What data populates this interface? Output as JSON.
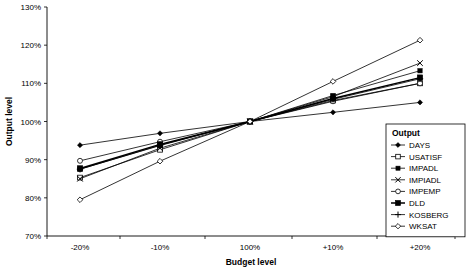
{
  "chart_data": {
    "type": "line",
    "title": "",
    "xlabel": "Budget level",
    "ylabel": "Output level",
    "categories": [
      "-20%",
      "-10%",
      "100%",
      "+10%",
      "+20%"
    ],
    "ytick_labels": [
      "70%",
      "80%",
      "90%",
      "100%",
      "110%",
      "120%",
      "130%"
    ],
    "ytick_values": [
      70,
      80,
      90,
      100,
      110,
      120,
      130
    ],
    "ylim": [
      70,
      130
    ],
    "grid": false,
    "legend_position": "right-inside",
    "legend_title": "Output",
    "series": [
      {
        "name": "DAYS",
        "marker": "filled-diamond",
        "values": [
          93.8,
          96.9,
          100,
          102.4,
          105.0
        ]
      },
      {
        "name": "USATISF",
        "marker": "open-square",
        "values": [
          85.3,
          92.6,
          100,
          105.5,
          110.0
        ]
      },
      {
        "name": "IMPADL",
        "marker": "filled-square",
        "values": [
          87.5,
          93.7,
          100,
          106.8,
          113.3
        ]
      },
      {
        "name": "IMPIADL",
        "marker": "cross-x",
        "values": [
          85.0,
          93.0,
          100,
          106.5,
          115.3
        ]
      },
      {
        "name": "IMPEMP",
        "marker": "open-circle",
        "values": [
          89.7,
          94.7,
          100,
          105.3,
          110.0
        ]
      },
      {
        "name": "DLD",
        "marker": "filled-square-bold",
        "values": [
          87.7,
          94.0,
          100,
          106.0,
          111.5
        ]
      },
      {
        "name": "KOSBERG",
        "marker": "plus",
        "values": [
          87.5,
          93.8,
          100,
          105.8,
          111.2
        ]
      },
      {
        "name": "WKSAT",
        "marker": "open-diamond",
        "values": [
          79.5,
          89.6,
          100,
          110.5,
          121.3
        ]
      }
    ]
  },
  "legend": {
    "title": "Output",
    "items": [
      {
        "label": "DAYS"
      },
      {
        "label": "USATISF"
      },
      {
        "label": "IMPADL"
      },
      {
        "label": "IMPIADL"
      },
      {
        "label": "IMPEMP"
      },
      {
        "label": "DLD"
      },
      {
        "label": "KOSBERG"
      },
      {
        "label": "WKSAT"
      }
    ]
  },
  "colors": {
    "axis": "#000000",
    "series": "#000000",
    "background": "#ffffff"
  }
}
